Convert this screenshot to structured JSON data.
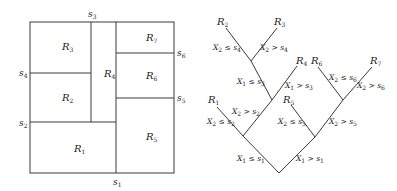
{
  "partition": {
    "boundary": {
      "x1": 30,
      "y1": 22,
      "x2": 174,
      "y2": 173
    },
    "regions": [
      {
        "id": "R1",
        "label": "R",
        "sub": "1",
        "x": 74,
        "y": 152
      },
      {
        "id": "R2",
        "label": "R",
        "sub": "2",
        "x": 62,
        "y": 101
      },
      {
        "id": "R3",
        "label": "R",
        "sub": "3",
        "x": 62,
        "y": 50
      },
      {
        "id": "R4",
        "label": "R",
        "sub": "4",
        "x": 104,
        "y": 77
      },
      {
        "id": "R5",
        "label": "R",
        "sub": "5",
        "x": 146,
        "y": 140
      },
      {
        "id": "R6",
        "label": "R",
        "sub": "6",
        "x": 146,
        "y": 79
      },
      {
        "id": "R7",
        "label": "R",
        "sub": "7",
        "x": 146,
        "y": 41
      }
    ],
    "splits": [
      {
        "id": "s1",
        "label": "s",
        "sub": "1",
        "x": 113,
        "y": 185
      },
      {
        "id": "s2",
        "label": "s",
        "sub": "2",
        "x": 19,
        "y": 126
      },
      {
        "id": "s3",
        "label": "s",
        "sub": "3",
        "x": 88,
        "y": 17
      },
      {
        "id": "s4",
        "label": "s",
        "sub": "4",
        "x": 19,
        "y": 76
      },
      {
        "id": "s5",
        "label": "s",
        "sub": "5",
        "x": 177,
        "y": 101
      },
      {
        "id": "s6",
        "label": "s",
        "sub": "6",
        "x": 177,
        "y": 56
      }
    ]
  },
  "tree": {
    "leaves": [
      {
        "id": "R1",
        "label": "R",
        "sub": "1",
        "x": 208,
        "y": 103
      },
      {
        "id": "R2",
        "label": "R",
        "sub": "2",
        "x": 217,
        "y": 25
      },
      {
        "id": "R3",
        "label": "R",
        "sub": "3",
        "x": 274,
        "y": 25
      },
      {
        "id": "R4",
        "label": "R",
        "sub": "4",
        "x": 296,
        "y": 64
      },
      {
        "id": "R5",
        "label": "R",
        "sub": "5",
        "x": 283,
        "y": 103
      },
      {
        "id": "R6",
        "label": "R",
        "sub": "6",
        "x": 311,
        "y": 64
      },
      {
        "id": "R7",
        "label": "R",
        "sub": "7",
        "x": 370,
        "y": 64
      }
    ],
    "edges": [
      {
        "var": "X",
        "vsub": "1",
        "op": "≤",
        "s": "s",
        "ssub": "1",
        "x": 237,
        "y": 161
      },
      {
        "var": "X",
        "vsub": "1",
        "op": ">",
        "s": "s",
        "ssub": "1",
        "x": 296,
        "y": 161
      },
      {
        "var": "X",
        "vsub": "2",
        "op": "≤",
        "s": "s",
        "ssub": "2",
        "x": 207,
        "y": 124
      },
      {
        "var": "X",
        "vsub": "2",
        "op": ">",
        "s": "s",
        "ssub": "2",
        "x": 232,
        "y": 114
      },
      {
        "var": "X",
        "vsub": "1",
        "op": "≤",
        "s": "s",
        "ssub": "3",
        "x": 237,
        "y": 84
      },
      {
        "var": "X",
        "vsub": "1",
        "op": ">",
        "s": "s",
        "ssub": "3",
        "x": 285,
        "y": 88
      },
      {
        "var": "X",
        "vsub": "2",
        "op": "≤",
        "s": "s",
        "ssub": "4",
        "x": 213,
        "y": 50
      },
      {
        "var": "X",
        "vsub": "2",
        "op": ">",
        "s": "s",
        "ssub": "4",
        "x": 260,
        "y": 50
      },
      {
        "var": "X",
        "vsub": "2",
        "op": "≤",
        "s": "s",
        "ssub": "5",
        "x": 278,
        "y": 124
      },
      {
        "var": "X",
        "vsub": "2",
        "op": ">",
        "s": "s",
        "ssub": "5",
        "x": 329,
        "y": 124
      },
      {
        "var": "X",
        "vsub": "2",
        "op": "≤",
        "s": "s",
        "ssub": "6",
        "x": 329,
        "y": 80
      },
      {
        "var": "X",
        "vsub": "2",
        "op": ">",
        "s": "s",
        "ssub": "6",
        "x": 357,
        "y": 88
      }
    ]
  }
}
